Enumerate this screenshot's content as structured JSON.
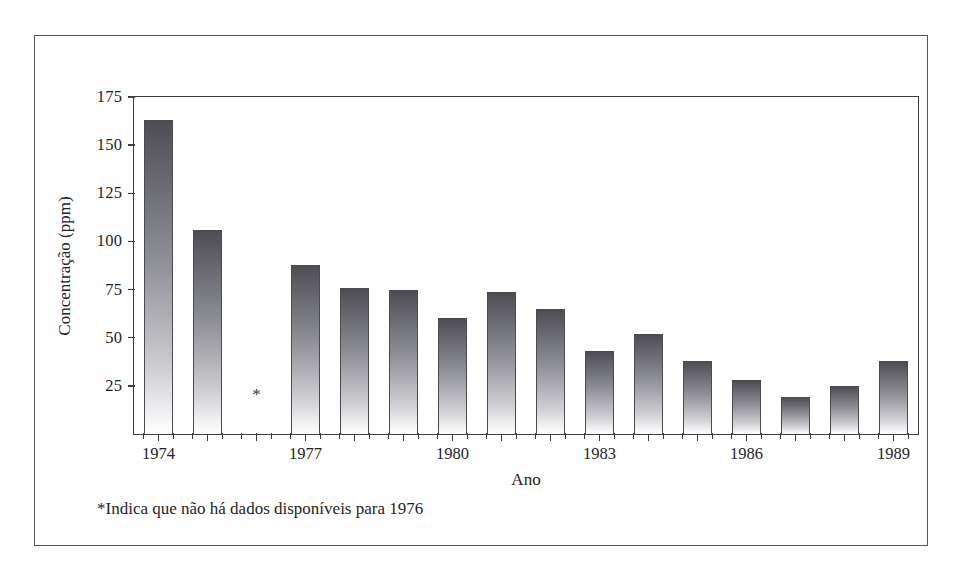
{
  "chart_data": {
    "type": "bar",
    "title": "",
    "xlabel": "Ano",
    "ylabel": "Concentração (ppm)",
    "ylim": [
      0,
      175
    ],
    "yticks": [
      25,
      50,
      75,
      100,
      125,
      150,
      175
    ],
    "ytick_labels": [
      "25",
      "50",
      "75",
      "100",
      "125",
      "150",
      "175"
    ],
    "grid": false,
    "legend": null,
    "categories": [
      "1974",
      "1975",
      "1976",
      "1977",
      "1978",
      "1979",
      "1980",
      "1981",
      "1982",
      "1983",
      "1984",
      "1985",
      "1986",
      "1987",
      "1988",
      "1989"
    ],
    "xtick_labels": [
      "1974",
      "1977",
      "1980",
      "1983",
      "1986",
      "1989"
    ],
    "xtick_label_categories": [
      "1974",
      "1977",
      "1980",
      "1983",
      "1986",
      "1989"
    ],
    "values": [
      163,
      106,
      null,
      88,
      76,
      75,
      60,
      74,
      65,
      43,
      52,
      38,
      28,
      19,
      25,
      38
    ],
    "missing_categories": [
      "1976"
    ],
    "missing_marker": "*",
    "annotations": [
      {
        "name": "missing-data-note",
        "text": "*Indica que não há dados disponíveis para 1976"
      }
    ],
    "bar_fill_top_color": "#4d4d53",
    "bar_fill_bottom_color": "#ffffff",
    "bar_edge_color": "#4a4a50",
    "axis_color": "#3c3c42",
    "frame_color": "#55555c",
    "background_color": "#ffffff"
  },
  "footnote": {
    "text": "*Indica que não há dados disponíveis para 1976"
  }
}
